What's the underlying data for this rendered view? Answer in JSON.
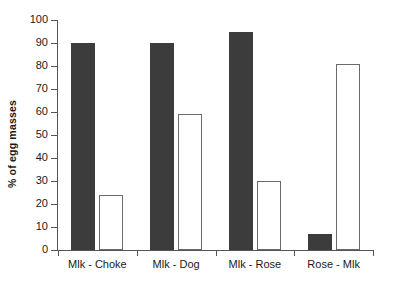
{
  "chart_data": {
    "type": "bar",
    "title": "",
    "xlabel": "",
    "ylabel": "% of egg masses",
    "ylim": [
      0,
      100
    ],
    "yticks": [
      0,
      10,
      20,
      30,
      40,
      50,
      60,
      70,
      80,
      90,
      100
    ],
    "ytick_labels": [
      "0",
      "10",
      "20",
      "30",
      "40",
      "50",
      "60",
      "70",
      "80",
      "90",
      "100"
    ],
    "grid": false,
    "legend": "none",
    "categories": [
      "Mlk - Choke",
      "Mlk - Dog",
      "Mlk - Rose",
      "Rose - Mlk"
    ],
    "series": [
      {
        "name": "dark",
        "color": "#3c3c3c",
        "values": [
          90,
          90,
          95,
          7
        ]
      },
      {
        "name": "light",
        "color": "#ffffff",
        "values": [
          24,
          59,
          30,
          81
        ]
      }
    ]
  },
  "axis": {
    "y_title": "% of egg masses"
  }
}
